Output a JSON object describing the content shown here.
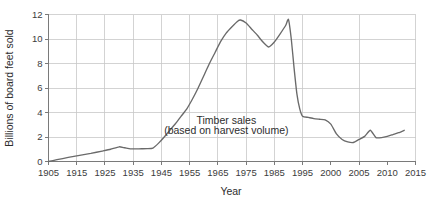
{
  "chart_data": {
    "type": "line",
    "title": "",
    "subtitle": "",
    "xlabel": "Year",
    "ylabel": "Billions of board feet sold",
    "ylim": [
      0,
      12
    ],
    "yticks": [
      0,
      2,
      4,
      6,
      8,
      10,
      12
    ],
    "ytick_labels": [
      "0",
      "2",
      "4",
      "6",
      "8",
      "10",
      "12"
    ],
    "xtick_labels": [
      "1905",
      "1915",
      "1925",
      "1935",
      "1945",
      "1955",
      "1965",
      "1975",
      "1985",
      "1995",
      "2000",
      "2005",
      "2010",
      "2015"
    ],
    "xtick_values": [
      1905,
      1915,
      1925,
      1935,
      1945,
      1955,
      1965,
      1975,
      1985,
      1995,
      2000,
      2005,
      2010,
      2015
    ],
    "grid": "both-major",
    "grid_x_values": [
      1915,
      1925,
      1935,
      1945,
      1955,
      1965,
      1975,
      1985,
      1995,
      2005,
      2015
    ],
    "legend": "none",
    "line_color": "#6a6a6a",
    "grid_color": "#c8c8c8",
    "axis_color": "#7a7a7a",
    "background_color": "#ffffff",
    "annotations": [
      {
        "id": "series-label-line1",
        "text": "Timber sales",
        "x": 1968,
        "y": 3.05
      },
      {
        "id": "series-label-line2",
        "text": "(based on harvest volume)",
        "x": 1968,
        "y": 2.25
      }
    ],
    "series": [
      {
        "name": "Timber sales (based on harvest volume)",
        "color": "#6a6a6a",
        "x": [
          1905,
          1908,
          1912,
          1916,
          1920,
          1924,
          1927,
          1930,
          1932,
          1934,
          1936,
          1938,
          1940,
          1942,
          1944,
          1946,
          1948,
          1950,
          1952,
          1954,
          1956,
          1958,
          1960,
          1962,
          1964,
          1966,
          1968,
          1970,
          1972,
          1973,
          1975,
          1977,
          1979,
          1981,
          1983,
          1985,
          1987,
          1989,
          1990,
          1991,
          1992,
          1993,
          1994,
          1995,
          1996,
          1997,
          1998,
          1999,
          2000,
          2001,
          2002,
          2003,
          2004,
          2005,
          2006,
          2007,
          2008,
          2009,
          2010,
          2011,
          2012,
          2013
        ],
        "values": [
          0.0,
          0.15,
          0.33,
          0.5,
          0.66,
          0.85,
          1.0,
          1.2,
          1.12,
          1.03,
          1.03,
          1.04,
          1.05,
          1.1,
          1.5,
          2.0,
          2.55,
          3.1,
          3.7,
          4.3,
          5.1,
          6.0,
          7.0,
          8.0,
          8.9,
          9.8,
          10.5,
          11.0,
          11.45,
          11.55,
          11.3,
          10.8,
          10.3,
          9.75,
          9.35,
          9.75,
          10.4,
          11.1,
          11.6,
          10.0,
          7.6,
          5.5,
          4.3,
          3.7,
          3.6,
          3.5,
          3.45,
          3.4,
          3.05,
          2.25,
          1.8,
          1.6,
          1.55,
          1.8,
          2.05,
          2.55,
          1.95,
          1.95,
          2.05,
          2.2,
          2.35,
          2.55
        ]
      }
    ]
  }
}
